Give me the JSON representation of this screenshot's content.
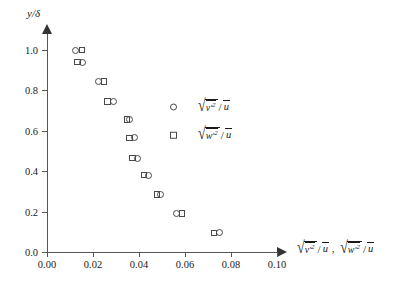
{
  "chart_data": {
    "type": "scatter",
    "title": "",
    "xlabel": "sqrt(v'^2)/u-bar, sqrt(w'^2)/u-bar",
    "ylabel": "y/delta",
    "xlim": [
      0.0,
      0.108
    ],
    "ylim": [
      0.0,
      1.09
    ],
    "grid": false,
    "legend_position": "inside-right",
    "xticks": [
      "0.00",
      "0.02",
      "0.04",
      "0.06",
      "0.08",
      "0.10"
    ],
    "xtick_values": [
      0.0,
      0.02,
      0.04,
      0.06,
      0.08,
      0.1
    ],
    "yticks": [
      "0.0",
      "0.2",
      "0.4",
      "0.6",
      "0.8",
      "1.0"
    ],
    "ytick_values": [
      0.0,
      0.2,
      0.4,
      0.6,
      0.8,
      1.0
    ],
    "series": [
      {
        "name": "sqrt(v'^2)/u-bar",
        "marker": "open-circle",
        "x": [
          0.0125,
          0.0155,
          0.0222,
          0.0288,
          0.0358,
          0.0382,
          0.0392,
          0.0443,
          0.0492,
          0.0562,
          0.0748
        ],
        "y": [
          1.0,
          0.94,
          0.845,
          0.745,
          0.655,
          0.565,
          0.465,
          0.38,
          0.285,
          0.19,
          0.095
        ]
      },
      {
        "name": "sqrt(w'^2)/u-bar",
        "marker": "open-square",
        "x": [
          0.0152,
          0.0132,
          0.0248,
          0.0262,
          0.0348,
          0.0358,
          0.0372,
          0.0422,
          0.0478,
          0.0588,
          0.0726
        ],
        "y": [
          1.0,
          0.94,
          0.845,
          0.745,
          0.655,
          0.565,
          0.465,
          0.38,
          0.285,
          0.19,
          0.095
        ]
      }
    ]
  },
  "axes": {
    "y_title": {
      "var": "y",
      "slash": "/",
      "delta": "δ"
    },
    "x_title": {
      "radical": "√",
      "term1": {
        "base": "v",
        "prime": "′",
        "exp": "2"
      },
      "term2": {
        "base": "w",
        "prime": "′",
        "exp": "2"
      },
      "denominator": "u",
      "slash": "/",
      "separator": ","
    }
  },
  "legend": {
    "entries": [
      {
        "marker": "open-circle",
        "marker_name": "circle-marker",
        "base": "v",
        "prime": "′",
        "exp": "2",
        "slash": "/",
        "denominator": "u"
      },
      {
        "marker": "open-square",
        "marker_name": "square-marker",
        "base": "w",
        "prime": "′",
        "exp": "2",
        "slash": "/",
        "denominator": "u"
      }
    ]
  }
}
